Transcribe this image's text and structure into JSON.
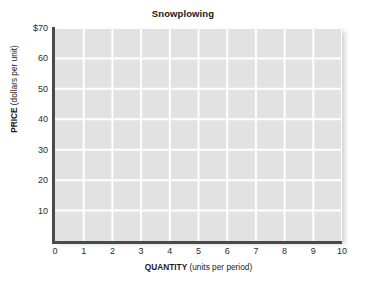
{
  "chart_data": {
    "type": "line",
    "title": "Snowplowing",
    "xlabel_bold": "QUANTITY",
    "xlabel_rest": " (units per period)",
    "ylabel_bold": "PRICE",
    "ylabel_rest": " (dollars per unit)",
    "xlabel": "QUANTITY (units per period)",
    "ylabel": "PRICE (dollars per unit)",
    "x": [
      0,
      1,
      2,
      3,
      4,
      5,
      6,
      7,
      8,
      9,
      10
    ],
    "xtick_labels": [
      "0",
      "1",
      "2",
      "3",
      "4",
      "5",
      "6",
      "7",
      "8",
      "9",
      "10"
    ],
    "y": [
      10,
      20,
      30,
      40,
      50,
      60,
      70
    ],
    "ytick_labels": [
      "10",
      "20",
      "30",
      "40",
      "50",
      "60",
      "$70"
    ],
    "xlim": [
      0,
      10
    ],
    "ylim": [
      0,
      70
    ],
    "grid": true,
    "legend": null,
    "series": [],
    "annotations": [],
    "plot_background": "#e2e2e2",
    "gridline_color": "#ffffff",
    "axis_color": "#4a4a4a",
    "text_color": "#1a1a1a",
    "note": "empty grid — no data series plotted"
  }
}
